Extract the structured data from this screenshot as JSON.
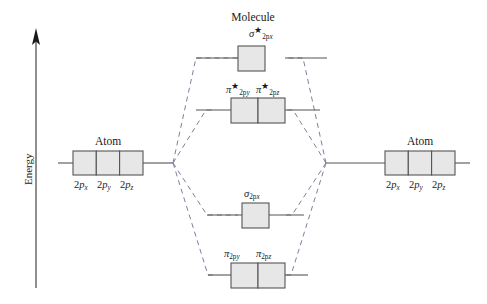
{
  "figure": {
    "type": "molecular-orbital-energy-diagram",
    "axis": {
      "label": "Energy",
      "direction": "up",
      "arrow": "up-arrow-icon"
    },
    "headings": {
      "molecule": "Molecule",
      "atom_left": "Atom",
      "atom_right": "Atom"
    },
    "atomic_orbitals": {
      "left": [
        {
          "base": "2p",
          "sub": "x",
          "full": "2px"
        },
        {
          "base": "2p",
          "sub": "y",
          "full": "2py"
        },
        {
          "base": "2p",
          "sub": "z",
          "full": "2pz"
        }
      ],
      "right": [
        {
          "base": "2p",
          "sub": "x",
          "full": "2px"
        },
        {
          "base": "2p",
          "sub": "y",
          "full": "2py"
        },
        {
          "base": "2p",
          "sub": "z",
          "full": "2pz"
        }
      ]
    },
    "molecular_orbitals": [
      {
        "id": "sigma-star-2px",
        "symbol": "σ",
        "star": "★",
        "antibonding": true,
        "sub_base": "2p",
        "sub_axis": "x",
        "degeneracy": 1,
        "level": "highest"
      },
      {
        "id": "pi-star-2py",
        "symbol": "π",
        "star": "★",
        "antibonding": true,
        "sub_base": "2p",
        "sub_axis": "y",
        "degeneracy": 2,
        "level": "second"
      },
      {
        "id": "pi-star-2pz",
        "symbol": "π",
        "star": "★",
        "antibonding": true,
        "sub_base": "2p",
        "sub_axis": "z",
        "degeneracy": 2,
        "level": "second"
      },
      {
        "id": "sigma-2px",
        "symbol": "σ",
        "star": "",
        "antibonding": false,
        "sub_base": "2p",
        "sub_axis": "x",
        "degeneracy": 1,
        "level": "third"
      },
      {
        "id": "pi-2py",
        "symbol": "π",
        "star": "",
        "antibonding": false,
        "sub_base": "2p",
        "sub_axis": "y",
        "degeneracy": 2,
        "level": "lowest"
      },
      {
        "id": "pi-2pz",
        "symbol": "π",
        "star": "",
        "antibonding": false,
        "sub_base": "2p",
        "sub_axis": "z",
        "degeneracy": 2,
        "level": "lowest"
      }
    ],
    "colors": {
      "box_fill": "#e7e7e7",
      "box_stroke": "#555555",
      "level_line": "#555555",
      "correlation_line": "#7f7f9a",
      "axis": "#333333",
      "text": "#1a1a1a"
    }
  }
}
